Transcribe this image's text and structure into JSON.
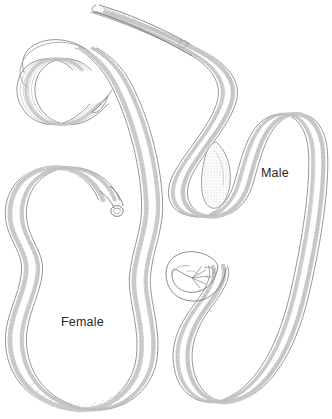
{
  "figure": {
    "kind": "scientific-line-illustration",
    "background_color": "#ffffff",
    "ink_color": "#8c8c8c",
    "ink_color_dark": "#6e6e6e",
    "ink_color_light": "#b9b9b9",
    "label_color": "#262626",
    "width": 332,
    "height": 419
  },
  "labels": {
    "female": "Female",
    "male": "Male"
  },
  "specimens": [
    {
      "id": "female",
      "label": "Female",
      "label_x": 61,
      "label_y": 315,
      "description": "Large female nematode coiled in an elongated C shape occupying the left half of the plate, tail hooked at upper left, anterior end with small terminal knob near center.",
      "features": [
        "cuticle-outline",
        "lateral-cords",
        "segmented-uterus-with-eggs",
        "hooked-tail",
        "anterior-knob"
      ]
    },
    {
      "id": "male",
      "label": "Male",
      "label_x": 261,
      "label_y": 166,
      "description": "Male nematode in serpentine S configuration across the right of the plate, tapered anterior head at top, curved posterior end bearing spicules at lower center.",
      "features": [
        "cuticle-outline",
        "lateral-cords",
        "testis-seminal-vesicle",
        "tapered-head",
        "curved-tail-with-spicules"
      ]
    }
  ]
}
